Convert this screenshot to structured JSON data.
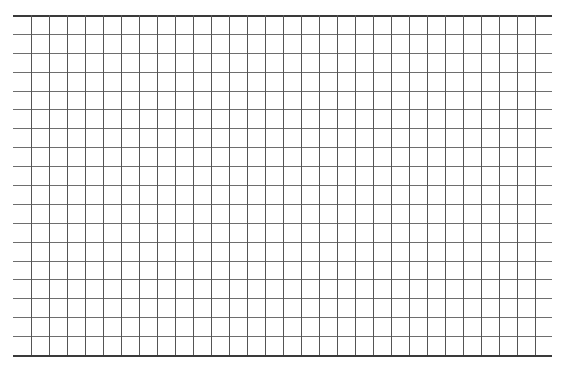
{
  "page": {
    "title_cut": ""
  },
  "grid": {
    "left": 13,
    "top": 15,
    "width": 539,
    "height": 340,
    "rows": 18,
    "first_vertical_x": 18,
    "column_spacing": 18,
    "vertical_count": 29,
    "line_color": "#6e6e6e",
    "edge_color": "#3a3a3a"
  }
}
